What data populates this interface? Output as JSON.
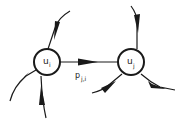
{
  "diagram": {
    "type": "graph",
    "colors": {
      "stroke": "#1a1a1a",
      "background": "#ffffff",
      "text": "#222222"
    },
    "nodes": [
      {
        "id": "ui",
        "label": "u",
        "subscript": "i"
      },
      {
        "id": "uj",
        "label": "u",
        "subscript": "j"
      }
    ],
    "edges": [
      {
        "from": "ui",
        "to": "uj",
        "label": "p",
        "subscript": "j,i"
      },
      {
        "from": "external",
        "to": "ui",
        "direction": "incoming",
        "position": "top-right"
      },
      {
        "from": "ui",
        "to": "external",
        "direction": "outgoing",
        "position": "lower-left"
      },
      {
        "from": "external",
        "to": "ui",
        "direction": "incoming",
        "position": "bottom"
      },
      {
        "from": "external",
        "to": "uj",
        "direction": "incoming",
        "position": "top"
      },
      {
        "from": "external",
        "to": "uj",
        "direction": "incoming",
        "position": "lower-left"
      },
      {
        "from": "uj",
        "to": "external",
        "direction": "outgoing",
        "position": "lower-right"
      }
    ]
  }
}
